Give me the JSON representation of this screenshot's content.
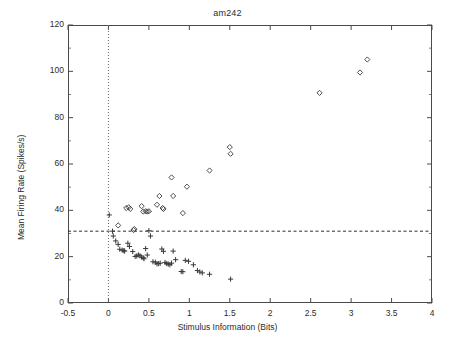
{
  "chart_data": {
    "type": "scatter",
    "title": "am242",
    "xlabel": "Stimulus Information (Bits)",
    "ylabel": "Mean Firing Rate (Spikes/s)",
    "xlim": [
      -0.5,
      4
    ],
    "ylim": [
      0,
      120
    ],
    "xticks": [
      -0.5,
      0,
      0.5,
      1,
      1.5,
      2,
      2.5,
      3,
      3.5,
      4
    ],
    "xtick_labels": [
      "-0.5",
      "0",
      "0.5",
      "1",
      "1.5",
      "2",
      "2.5",
      "3",
      "3.5",
      "4"
    ],
    "yticks": [
      0,
      20,
      40,
      60,
      80,
      100,
      120
    ],
    "ytick_labels": [
      "0",
      "20",
      "40",
      "60",
      "80",
      "100",
      "120"
    ],
    "grid": false,
    "legend": "none",
    "marker_color": "#3a3a3a",
    "axis_color": "#4a4a4a",
    "reference_lines": [
      {
        "name": "mean-rate-threshold",
        "orientation": "horizontal",
        "y": 31,
        "style": "dashed"
      },
      {
        "name": "zero-information",
        "orientation": "vertical",
        "x": 0,
        "style": "dotted"
      }
    ],
    "series": [
      {
        "name": "above-threshold-diamonds",
        "marker": "diamond",
        "points": [
          [
            0.12,
            33.5
          ],
          [
            0.22,
            41.0
          ],
          [
            0.25,
            41.3
          ],
          [
            0.27,
            40.6
          ],
          [
            0.31,
            31.5
          ],
          [
            0.32,
            31.9
          ],
          [
            0.41,
            41.8
          ],
          [
            0.43,
            39.5
          ],
          [
            0.46,
            39.6
          ],
          [
            0.48,
            39.5
          ],
          [
            0.5,
            39.6
          ],
          [
            0.6,
            42.4
          ],
          [
            0.63,
            46.2
          ],
          [
            0.67,
            41.0
          ],
          [
            0.68,
            40.6
          ],
          [
            0.78,
            54.2
          ],
          [
            0.8,
            46.2
          ],
          [
            0.92,
            38.8
          ],
          [
            0.97,
            50.2
          ],
          [
            1.25,
            57.2
          ],
          [
            1.5,
            67.3
          ],
          [
            1.51,
            64.4
          ],
          [
            2.61,
            90.7
          ],
          [
            3.11,
            99.5
          ],
          [
            3.2,
            105.1
          ]
        ]
      },
      {
        "name": "below-threshold-plus",
        "marker": "plus",
        "points": [
          [
            0.01,
            38.0
          ],
          [
            0.05,
            31.0
          ],
          [
            0.06,
            28.9
          ],
          [
            0.09,
            26.8
          ],
          [
            0.12,
            25.3
          ],
          [
            0.14,
            23.2
          ],
          [
            0.17,
            22.8
          ],
          [
            0.19,
            22.6
          ],
          [
            0.2,
            22.4
          ],
          [
            0.24,
            25.8
          ],
          [
            0.26,
            24.4
          ],
          [
            0.3,
            22.2
          ],
          [
            0.33,
            20.1
          ],
          [
            0.35,
            20.3
          ],
          [
            0.37,
            20.8
          ],
          [
            0.39,
            20.4
          ],
          [
            0.41,
            19.8
          ],
          [
            0.43,
            19.5
          ],
          [
            0.44,
            19.1
          ],
          [
            0.46,
            23.5
          ],
          [
            0.48,
            20.7
          ],
          [
            0.5,
            31.2
          ],
          [
            0.52,
            28.9
          ],
          [
            0.55,
            17.8
          ],
          [
            0.58,
            17.6
          ],
          [
            0.6,
            16.9
          ],
          [
            0.62,
            17.0
          ],
          [
            0.64,
            17.2
          ],
          [
            0.66,
            23.3
          ],
          [
            0.68,
            22.3
          ],
          [
            0.7,
            17.5
          ],
          [
            0.72,
            17.0
          ],
          [
            0.74,
            16.8
          ],
          [
            0.76,
            16.5
          ],
          [
            0.78,
            17.2
          ],
          [
            0.8,
            22.4
          ],
          [
            0.83,
            18.7
          ],
          [
            0.9,
            13.6
          ],
          [
            0.92,
            13.5
          ],
          [
            0.95,
            18.4
          ],
          [
            0.99,
            18.0
          ],
          [
            1.05,
            16.5
          ],
          [
            1.1,
            14.0
          ],
          [
            1.13,
            13.4
          ],
          [
            1.16,
            13.0
          ],
          [
            1.25,
            12.4
          ],
          [
            1.51,
            10.3
          ]
        ]
      }
    ]
  }
}
